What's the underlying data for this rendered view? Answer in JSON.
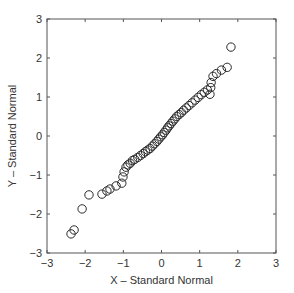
{
  "chart_data": {
    "type": "scatter",
    "title": "",
    "xlabel": "X – Standard Normal",
    "ylabel": "Y – Standard Normal",
    "xlim": [
      -3,
      3
    ],
    "ylim": [
      -3,
      3
    ],
    "xticks": [
      -3,
      -2,
      -1,
      0,
      1,
      2,
      3
    ],
    "yticks": [
      -3,
      -2,
      -1,
      0,
      1,
      2,
      3
    ],
    "grid": false,
    "box": true,
    "marker": "open-circle",
    "legend": null,
    "points": [
      [
        -2.37,
        -2.51
      ],
      [
        -2.29,
        -2.41
      ],
      [
        -2.08,
        -1.87
      ],
      [
        -1.9,
        -1.51
      ],
      [
        -1.56,
        -1.49
      ],
      [
        -1.43,
        -1.41
      ],
      [
        -1.35,
        -1.36
      ],
      [
        -1.19,
        -1.28
      ],
      [
        -1.04,
        -1.21
      ],
      [
        -1.01,
        -1.05
      ],
      [
        -0.98,
        -0.92
      ],
      [
        -0.93,
        -0.8
      ],
      [
        -0.88,
        -0.74
      ],
      [
        -0.82,
        -0.7
      ],
      [
        -0.76,
        -0.63
      ],
      [
        -0.7,
        -0.6
      ],
      [
        -0.62,
        -0.55
      ],
      [
        -0.55,
        -0.5
      ],
      [
        -0.48,
        -0.45
      ],
      [
        -0.42,
        -0.4
      ],
      [
        -0.36,
        -0.36
      ],
      [
        -0.3,
        -0.32
      ],
      [
        -0.24,
        -0.26
      ],
      [
        -0.18,
        -0.2
      ],
      [
        -0.12,
        -0.14
      ],
      [
        -0.07,
        -0.08
      ],
      [
        -0.02,
        -0.02
      ],
      [
        0.03,
        0.03
      ],
      [
        0.07,
        0.09
      ],
      [
        0.12,
        0.15
      ],
      [
        0.16,
        0.21
      ],
      [
        0.2,
        0.26
      ],
      [
        0.25,
        0.32
      ],
      [
        0.3,
        0.38
      ],
      [
        0.35,
        0.44
      ],
      [
        0.4,
        0.5
      ],
      [
        0.46,
        0.55
      ],
      [
        0.52,
        0.6
      ],
      [
        0.58,
        0.66
      ],
      [
        0.65,
        0.72
      ],
      [
        0.72,
        0.78
      ],
      [
        0.8,
        0.85
      ],
      [
        0.88,
        0.92
      ],
      [
        0.96,
        0.99
      ],
      [
        1.04,
        1.06
      ],
      [
        1.12,
        1.12
      ],
      [
        1.2,
        1.18
      ],
      [
        1.29,
        1.24
      ],
      [
        1.27,
        1.07
      ],
      [
        1.3,
        1.37
      ],
      [
        1.35,
        1.53
      ],
      [
        1.44,
        1.6
      ],
      [
        1.57,
        1.69
      ],
      [
        1.72,
        1.76
      ],
      [
        1.82,
        2.28
      ]
    ]
  }
}
